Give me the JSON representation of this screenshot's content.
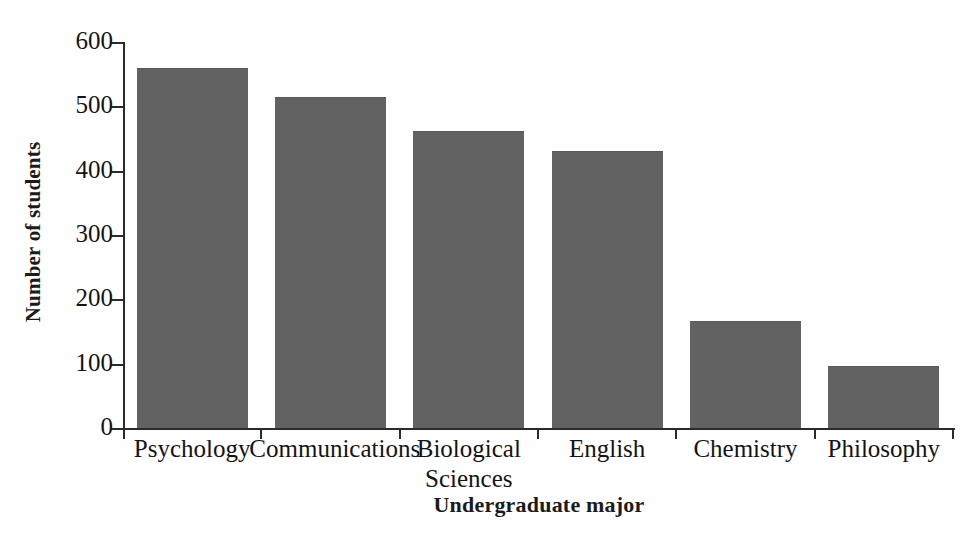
{
  "chart_data": {
    "type": "bar",
    "title": "",
    "xlabel": "Undergraduate major",
    "ylabel": "Number of students",
    "categories": [
      "Psychology",
      "Communications",
      "Biological Sciences",
      "English",
      "Chemistry",
      "Philosophy"
    ],
    "category_lines": [
      [
        "Psychology"
      ],
      [
        "Communications"
      ],
      [
        "Biological",
        "Sciences"
      ],
      [
        "English"
      ],
      [
        "Chemistry"
      ],
      [
        "Philosophy"
      ]
    ],
    "values": [
      560,
      515,
      462,
      430,
      167,
      96
    ],
    "ylim": [
      0,
      600
    ],
    "yticks": [
      0,
      100,
      200,
      300,
      400,
      500,
      600
    ],
    "ytick_labels": [
      "0",
      "100",
      "200",
      "300",
      "400",
      "500",
      "600"
    ],
    "grid": false,
    "legend": false,
    "bar_color": "#626262",
    "axis_color": "#2b2b2b",
    "background": "#fefefe"
  }
}
